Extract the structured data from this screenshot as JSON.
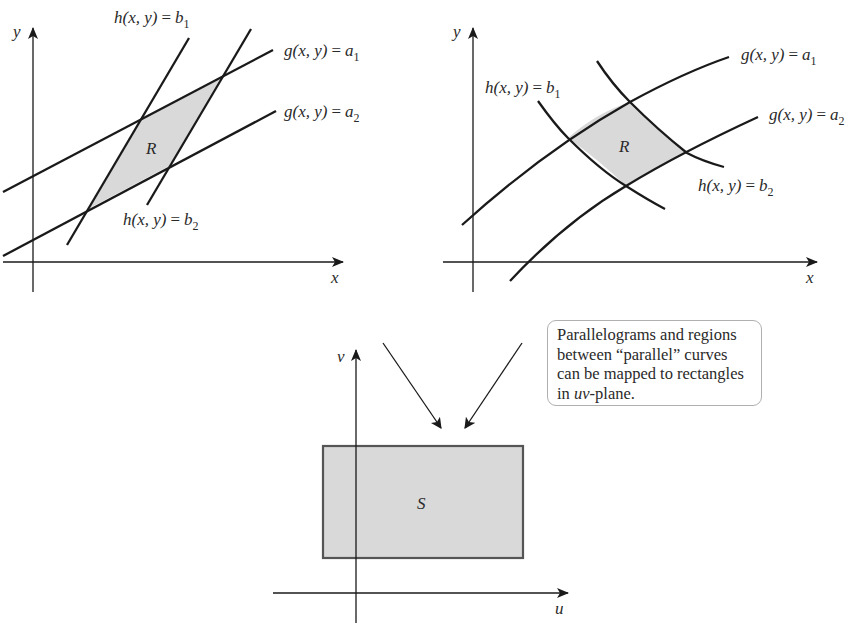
{
  "figure": {
    "left_panel": {
      "title": "Parallelogram region R in xy-plane bounded by straight lines",
      "axes": {
        "x_label": "x",
        "y_label": "y"
      },
      "region_label": "R",
      "curves": [
        {
          "id": "g_a1",
          "func": "g(x, y)",
          "eq": "=",
          "value": "a",
          "sub": "1",
          "type": "line"
        },
        {
          "id": "g_a2",
          "func": "g(x, y)",
          "eq": "=",
          "value": "a",
          "sub": "2",
          "type": "line"
        },
        {
          "id": "h_b1",
          "func": "h(x, y)",
          "eq": "=",
          "value": "b",
          "sub": "1",
          "type": "line"
        },
        {
          "id": "h_b2",
          "func": "h(x, y)",
          "eq": "=",
          "value": "b",
          "sub": "2",
          "type": "line"
        }
      ]
    },
    "right_panel": {
      "title": "Curvilinear region R in xy-plane bounded by curves",
      "axes": {
        "x_label": "x",
        "y_label": "y"
      },
      "region_label": "R",
      "curves": [
        {
          "id": "g_a1",
          "func": "g(x, y)",
          "eq": "=",
          "value": "a",
          "sub": "1",
          "type": "curve"
        },
        {
          "id": "g_a2",
          "func": "g(x, y)",
          "eq": "=",
          "value": "a",
          "sub": "2",
          "type": "curve"
        },
        {
          "id": "h_b1",
          "func": "h(x, y)",
          "eq": "=",
          "value": "b",
          "sub": "1",
          "type": "curve"
        },
        {
          "id": "h_b2",
          "func": "h(x, y)",
          "eq": "=",
          "value": "b",
          "sub": "2",
          "type": "curve"
        }
      ]
    },
    "bottom_panel": {
      "title": "Rectangle S in uv-plane",
      "axes": {
        "x_label": "u",
        "y_label": "v"
      },
      "region_label": "S"
    },
    "callout": {
      "lines": [
        "Parallelograms and regions",
        "between “parallel” curves",
        "can be mapped to rectangles"
      ],
      "last_line_prefix": "in ",
      "last_line_em": "uv",
      "last_line_suffix": "-plane."
    },
    "colors": {
      "stroke": "#1a1a1a",
      "region_fill": "#d9d9d9",
      "callout_border": "#b0b0b0"
    }
  }
}
